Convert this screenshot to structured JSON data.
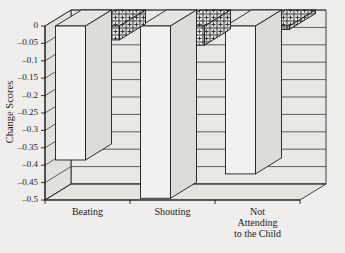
{
  "chart_data": {
    "type": "bar",
    "title": "",
    "subtitle": "",
    "xlabel": "",
    "ylabel": "Change Scores",
    "ylim": [
      -0.5,
      0
    ],
    "grid": true,
    "legend_position": "none",
    "style": "3d-grouped-bar",
    "categories": [
      "Beating",
      "Shouting",
      "Not Attending to the Child"
    ],
    "category_labels_multiline": [
      [
        "Beating"
      ],
      [
        "Shouting"
      ],
      [
        "Not",
        "Attending",
        "to the Child"
      ]
    ],
    "ytick_labels": [
      "0",
      "-0.05",
      "-0.1",
      "-0.15",
      "-0.2",
      "-0.25",
      "-0.3",
      "-0.35",
      "-0.4",
      "-0.45",
      "-0.5"
    ],
    "ytick_values": [
      0,
      -0.05,
      -0.1,
      -0.15,
      -0.2,
      -0.25,
      -0.3,
      -0.35,
      -0.4,
      -0.45,
      -0.5
    ],
    "series": [
      {
        "name": "series-1",
        "fill": "plain",
        "values": [
          -0.385,
          -0.495,
          -0.425
        ]
      },
      {
        "name": "series-2",
        "fill": "crosshatch",
        "values": [
          -0.04,
          -0.055,
          -0.01
        ]
      }
    ],
    "colors": {
      "background": "#efeeec",
      "wall": "#e9e8e5",
      "outline": "#1b1b1b",
      "bar_plain": "#f2f1ef",
      "bar_hatch_bg": "#f2f1ef",
      "bar_hatch_line": "#3a3a3a"
    }
  }
}
